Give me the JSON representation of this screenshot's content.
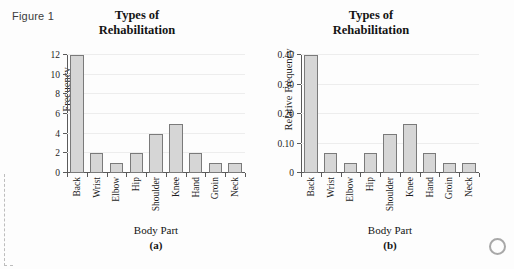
{
  "figure": {
    "label": "Figure 1"
  },
  "panels": [
    {
      "id": "a",
      "title_line1": "Types of",
      "title_line2": "Rehabilitation",
      "ylabel": "Frequency",
      "xlabel": "Body Part",
      "subcaption": "(a)",
      "yticks": [
        "0",
        "2",
        "4",
        "6",
        "8",
        "10",
        "12"
      ]
    },
    {
      "id": "b",
      "title_line1": "Types of",
      "title_line2": "Rehabilitation",
      "ylabel": "Relative Frequency",
      "xlabel": "Body Part",
      "subcaption": "(b)",
      "yticks": [
        "0",
        "0.10",
        "0.20",
        "0.30",
        "0.40"
      ]
    }
  ],
  "colors": {
    "bar_fill": "#d6d6d6",
    "bar_stroke": "#7a7a7a",
    "axis": "#5a5a5a",
    "grid": "#ededed",
    "background": "#fdfdfd"
  },
  "chart_data": [
    {
      "type": "bar",
      "title": "Types of Rehabilitation",
      "subcaption": "(a)",
      "xlabel": "Body Part",
      "ylabel": "Frequency",
      "categories": [
        "Back",
        "Wrist",
        "Elbow",
        "Hip",
        "Shoulder",
        "Knee",
        "Hand",
        "Groin",
        "Neck"
      ],
      "values": [
        12,
        2,
        1,
        2,
        4,
        5,
        2,
        1,
        1
      ],
      "ylim": [
        0,
        12
      ],
      "yticks": [
        0,
        2,
        4,
        6,
        8,
        10,
        12
      ],
      "grid": true,
      "legend": null
    },
    {
      "type": "bar",
      "title": "Types of Rehabilitation",
      "subcaption": "(b)",
      "xlabel": "Body Part",
      "ylabel": "Relative Frequency",
      "categories": [
        "Back",
        "Wrist",
        "Elbow",
        "Hip",
        "Shoulder",
        "Knee",
        "Hand",
        "Groin",
        "Neck"
      ],
      "values": [
        0.4,
        0.067,
        0.033,
        0.067,
        0.133,
        0.167,
        0.067,
        0.033,
        0.033
      ],
      "ylim": [
        0,
        0.4
      ],
      "yticks": [
        0,
        0.1,
        0.2,
        0.3,
        0.4
      ],
      "grid": true,
      "legend": null
    }
  ]
}
